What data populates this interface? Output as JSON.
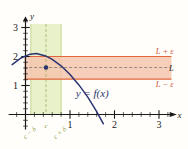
{
  "figure": {
    "name": "epsilon-delta-limit-graph",
    "background": "#fffefb"
  },
  "colors": {
    "curve": "#2b3570",
    "epsilon_band_fill": "#f5c6ad",
    "epsilon_band_edge": "#e2663c",
    "delta_band_fill": "#e8f0c8",
    "delta_band_edge": "#b9cf7a",
    "axis": "#1a1a1a",
    "dashed_guide": "#6b6b6b",
    "label_orange": "#d2593a",
    "label_olive": "#8a9a3c",
    "point": "#2b3570"
  },
  "axes": {
    "x_axis_label": "x",
    "y_axis_label": "y",
    "x_ticks": [
      {
        "value": 1,
        "label": "1"
      },
      {
        "value": 2,
        "label": "2"
      },
      {
        "value": 3,
        "label": "3"
      }
    ],
    "y_ticks": [
      {
        "value": 1,
        "label": "1"
      },
      {
        "value": 2,
        "label": "2"
      },
      {
        "value": 3,
        "label": "3"
      }
    ],
    "x_range": [
      -0.35,
      3.35
    ],
    "y_range": [
      -0.55,
      3.35
    ],
    "minor_ticks": true,
    "arrowheads": [
      "x-positive",
      "y-positive"
    ]
  },
  "annotations": {
    "curve_label": "y = f(x)",
    "epsilon_upper": "L + ε",
    "limit_level": "L",
    "epsilon_lower": "L − ε",
    "delta_left": "c − δ",
    "delta_center": "c",
    "delta_right": "c + δ"
  },
  "chart_data": {
    "type": "line",
    "title": "",
    "xlabel": "x",
    "ylabel": "y",
    "xlim": [
      -0.35,
      3.35
    ],
    "ylim": [
      -0.55,
      3.35
    ],
    "grid": false,
    "legend": "none",
    "series": [
      {
        "name": "y = f(x)",
        "color": "#2b3570",
        "x": [
          -0.3,
          -0.1,
          0.1,
          0.25,
          0.45,
          0.6,
          0.8,
          1.0,
          1.2,
          1.4,
          1.6,
          1.75
        ],
        "y": [
          1.72,
          1.95,
          2.08,
          2.1,
          2.02,
          1.9,
          1.68,
          1.38,
          1.02,
          0.6,
          0.1,
          -0.32
        ]
      }
    ],
    "bands": [
      {
        "name": "epsilon-band",
        "orientation": "horizontal",
        "y_low": 1.22,
        "y_high": 2.0,
        "fill": "#f5c6ad",
        "edge": "#e2663c",
        "labels": {
          "top": "L + ε",
          "bottom": "L − ε"
        }
      },
      {
        "name": "delta-band",
        "orientation": "vertical",
        "x_low": 0.12,
        "x_high": 0.8,
        "fill": "#e8f0c8",
        "edge": "#b9cf7a",
        "labels": {
          "left": "c − δ",
          "right": "c + δ"
        }
      }
    ],
    "guides": [
      {
        "name": "limit-line",
        "orientation": "horizontal",
        "y": 1.62,
        "label": "L",
        "style": "dashed"
      },
      {
        "name": "c-line",
        "orientation": "vertical",
        "x": 0.46,
        "label": "c",
        "style": "dashed"
      }
    ],
    "points": [
      {
        "name": "c-f(c)",
        "x": 0.46,
        "y": 1.62,
        "marker": "dot",
        "color": "#2b3570"
      }
    ]
  }
}
